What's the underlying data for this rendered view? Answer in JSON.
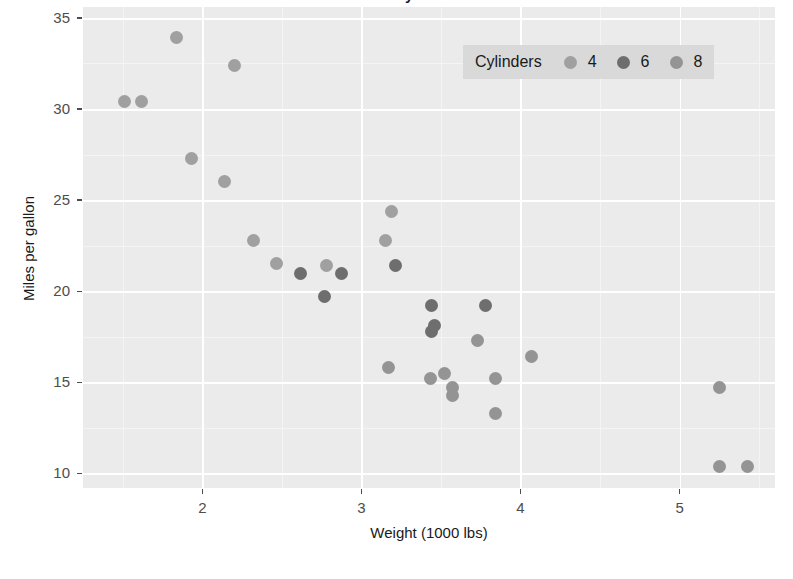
{
  "chart_data": {
    "type": "scatter",
    "title": "Fuel Economy of 32 Automobiles",
    "xlabel": "Weight (1000 lbs)",
    "ylabel": "Miles per gallon",
    "xlim": [
      1.25,
      5.6
    ],
    "ylim": [
      9.2,
      35.6
    ],
    "xticks": [
      2,
      3,
      4,
      5
    ],
    "yticks": [
      10,
      15,
      20,
      25,
      30,
      35
    ],
    "x_minor_ticks": [
      1.5,
      2.5,
      3.5,
      4.5,
      5.5
    ],
    "y_minor_ticks": [
      12.5,
      17.5,
      22.5,
      27.5,
      32.5
    ],
    "grid": true,
    "panel_background": "#ebebeb",
    "gridline_color": "#ffffff",
    "legend": {
      "title": "Cylinders",
      "position": "top-right-inside",
      "orientation": "horizontal",
      "background": "#d9d9d9",
      "entries": [
        {
          "label": "4",
          "color": "#a0a0a0"
        },
        {
          "label": "6",
          "color": "#6e6e6e"
        },
        {
          "label": "8",
          "color": "#949494"
        }
      ]
    },
    "series": [
      {
        "name": "4",
        "color": "#a0a0a0",
        "points": [
          {
            "x": 1.513,
            "y": 30.4
          },
          {
            "x": 1.615,
            "y": 30.4
          },
          {
            "x": 1.835,
            "y": 33.9
          },
          {
            "x": 1.935,
            "y": 27.3
          },
          {
            "x": 2.14,
            "y": 26.0
          },
          {
            "x": 2.2,
            "y": 32.4
          },
          {
            "x": 2.32,
            "y": 22.8
          },
          {
            "x": 2.465,
            "y": 21.5
          },
          {
            "x": 2.78,
            "y": 21.4
          },
          {
            "x": 3.15,
            "y": 22.8
          },
          {
            "x": 3.19,
            "y": 24.4
          }
        ]
      },
      {
        "name": "6",
        "color": "#6e6e6e",
        "points": [
          {
            "x": 2.62,
            "y": 21.0
          },
          {
            "x": 2.875,
            "y": 21.0
          },
          {
            "x": 2.77,
            "y": 19.7
          },
          {
            "x": 3.215,
            "y": 21.4
          },
          {
            "x": 3.44,
            "y": 19.2
          },
          {
            "x": 3.44,
            "y": 17.8
          },
          {
            "x": 3.46,
            "y": 18.1
          },
          {
            "x": 3.78,
            "y": 19.2
          }
        ]
      },
      {
        "name": "8",
        "color": "#949494",
        "points": [
          {
            "x": 3.17,
            "y": 15.8
          },
          {
            "x": 3.435,
            "y": 15.2
          },
          {
            "x": 3.52,
            "y": 15.5
          },
          {
            "x": 3.57,
            "y": 14.3
          },
          {
            "x": 3.57,
            "y": 14.7
          },
          {
            "x": 3.73,
            "y": 17.3
          },
          {
            "x": 3.84,
            "y": 15.2
          },
          {
            "x": 3.845,
            "y": 13.3
          },
          {
            "x": 4.07,
            "y": 16.4
          },
          {
            "x": 5.25,
            "y": 14.7
          },
          {
            "x": 5.25,
            "y": 10.4
          },
          {
            "x": 5.424,
            "y": 10.4
          }
        ]
      }
    ]
  }
}
